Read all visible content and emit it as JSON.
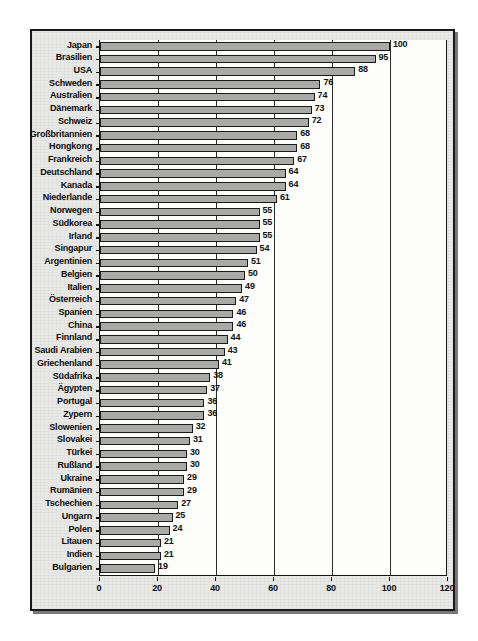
{
  "chart_data": {
    "type": "bar",
    "orientation": "horizontal",
    "title": "",
    "subtitle": "",
    "xlabel": "",
    "ylabel": "",
    "xlim": [
      0,
      120
    ],
    "xticks": [
      0,
      20,
      40,
      60,
      80,
      100,
      120
    ],
    "xtick_labels": [
      "0",
      "20",
      "40",
      "60",
      "80",
      "100",
      "120"
    ],
    "grid": true,
    "grid_axis": "x",
    "legend": null,
    "bar_color": "#a9a9a7",
    "bar_border_color": "#1b1b1b",
    "axis_color": "#141414",
    "text_color": "#0d0d0d",
    "background_color": "#e8e8e6",
    "plot_background_color": "#fdfdfc",
    "show_value_labels": true,
    "categories": [
      "Japan",
      "Brasilien",
      "USA",
      "Schweden",
      "Australien",
      "Dänemark",
      "Schweiz",
      "Großbritannien",
      "Hongkong",
      "Frankreich",
      "Deutschland",
      "Kanada",
      "Niederlande",
      "Norwegen",
      "Südkorea",
      "Irland",
      "Singapur",
      "Argentinien",
      "Belgien",
      "Italien",
      "Österreich",
      "Spanien",
      "China",
      "Finnland",
      "Saudi Arabien",
      "Griechenland",
      "Südafrika",
      "Ägypten",
      "Portugal",
      "Zypern",
      "Slowenien",
      "Slovakei",
      "Türkei",
      "Rußland",
      "Ukraine",
      "Rumänien",
      "Tschechien",
      "Ungarn",
      "Polen",
      "Litauen",
      "Indien",
      "Bulgarien"
    ],
    "values": [
      100,
      95,
      88,
      76,
      74,
      73,
      72,
      68,
      68,
      67,
      64,
      64,
      61,
      55,
      55,
      55,
      54,
      51,
      50,
      49,
      47,
      46,
      46,
      44,
      43,
      41,
      38,
      37,
      36,
      36,
      32,
      31,
      30,
      30,
      29,
      29,
      27,
      25,
      24,
      21,
      21,
      19
    ],
    "value_labels": [
      "100",
      "95",
      "88",
      "76",
      "74",
      "73",
      "72",
      "68",
      "68",
      "67",
      "64",
      "64",
      "61",
      "55",
      "55",
      "55",
      "54",
      "51",
      "50",
      "49",
      "47",
      "46",
      "46",
      "44",
      "43",
      "41",
      "38",
      "37",
      "36",
      "36",
      "32",
      "31",
      "30",
      "30",
      "29",
      "29",
      "27",
      "25",
      "24",
      "21",
      "21",
      "19"
    ]
  }
}
